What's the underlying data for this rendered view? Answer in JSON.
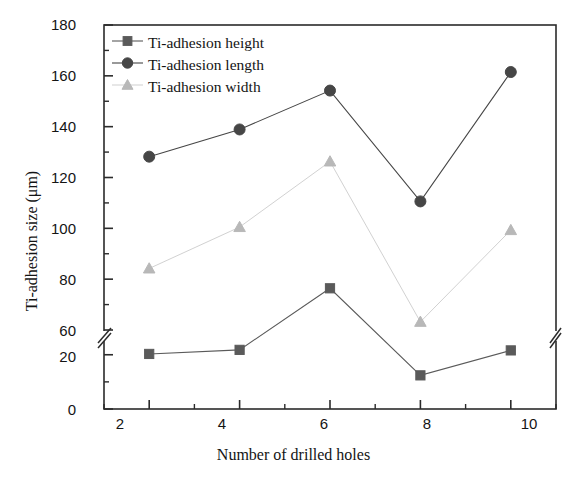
{
  "chart_data": {
    "type": "line",
    "title": "",
    "xlabel": "Number of drilled holes",
    "ylabel": "Ti-adhesion size (μm)",
    "x": [
      2,
      4,
      6,
      8,
      10
    ],
    "xticks": [
      "2",
      "4",
      "6",
      "8",
      "10"
    ],
    "xlim": [
      1,
      11
    ],
    "yticks_lower": [
      "0",
      "20"
    ],
    "yticks_upper": [
      "60",
      "80",
      "100",
      "120",
      "140",
      "160",
      "180"
    ],
    "ylim_lower": [
      0,
      25
    ],
    "ylim_upper": [
      55,
      180
    ],
    "axis_break": true,
    "grid": false,
    "legend_position": "top-left",
    "series": [
      {
        "name": "Ti-adhesion height",
        "marker": "square",
        "color": "#5a5a5a",
        "values": [
          20.3,
          21.8,
          44.5,
          12.4,
          21.6
        ]
      },
      {
        "name": "Ti-adhesion length",
        "marker": "circle",
        "color": "#464646",
        "values": [
          128.2,
          138.9,
          154.2,
          110.6,
          161.5
        ]
      },
      {
        "name": "Ti-adhesion width",
        "marker": "triangle",
        "color": "#b8b8b8",
        "values": [
          84.2,
          100.5,
          126.3,
          63.2,
          99.3
        ]
      }
    ]
  },
  "legend": {
    "items": [
      {
        "label": "Ti-adhesion height"
      },
      {
        "label": "Ti-adhesion length"
      },
      {
        "label": "Ti-adhesion width"
      }
    ]
  },
  "ytick_labels": [
    "180",
    "160",
    "140",
    "120",
    "100",
    "80",
    "60",
    "20",
    "0"
  ],
  "colors": {
    "axis": "#2b2b2b",
    "height_series": "#5a5a5a",
    "length_series": "#464646",
    "width_series": "#b8b8b8"
  }
}
